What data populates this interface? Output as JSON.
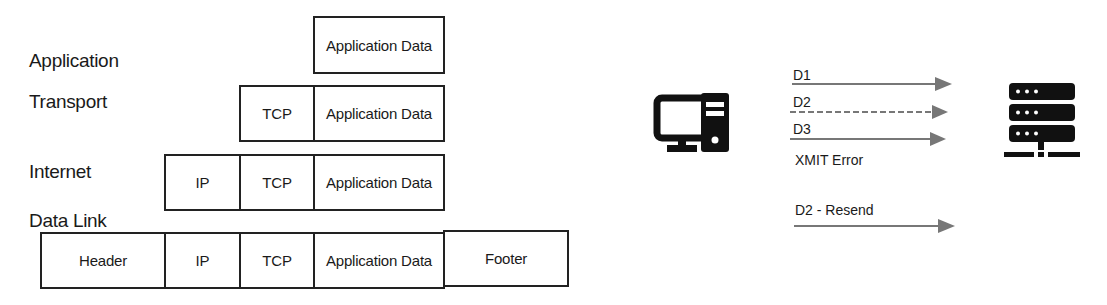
{
  "encapsulation": {
    "layers": [
      {
        "label": "Application",
        "segments": [
          "Application Data"
        ]
      },
      {
        "label": "Transport",
        "segments": [
          "TCP",
          "Application Data"
        ]
      },
      {
        "label": "Internet",
        "segments": [
          "IP",
          "TCP",
          "Application Data"
        ]
      },
      {
        "label": "Data Link",
        "segments": [
          "Header",
          "IP",
          "TCP",
          "Application Data",
          "Footer"
        ]
      }
    ]
  },
  "transmission": {
    "client_icon": "desktop-computer-icon",
    "server_icon": "server-network-icon",
    "arrows": [
      {
        "label": "D1",
        "style": "solid"
      },
      {
        "label": "D2",
        "style": "dashed"
      },
      {
        "label": "D3",
        "style": "solid"
      }
    ],
    "error_label": "XMIT Error",
    "resend": {
      "label": "D2 - Resend",
      "style": "solid"
    },
    "arrow_color": "#777777"
  }
}
